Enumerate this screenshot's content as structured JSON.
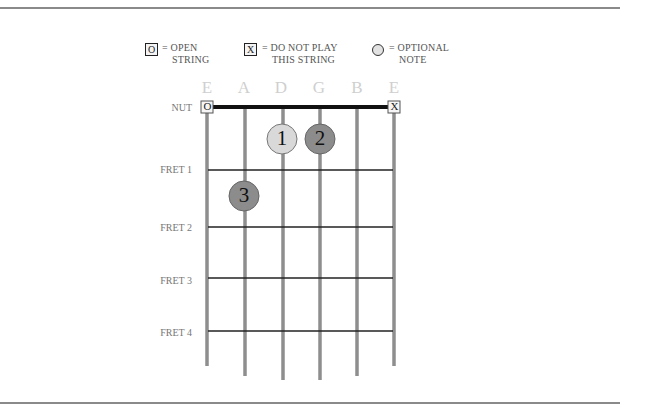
{
  "legend": [
    {
      "symbol": "O",
      "symbol_type": "box",
      "text_line1": "= OPEN",
      "text_line2": "STRING"
    },
    {
      "symbol": "X",
      "symbol_type": "box",
      "text_line1": "= DO NOT PLAY",
      "text_line2": "THIS STRING"
    },
    {
      "symbol": "",
      "symbol_type": "circle",
      "text_line1": "= OPTIONAL",
      "text_line2": "NOTE"
    }
  ],
  "strings": [
    "E",
    "A",
    "D",
    "G",
    "B",
    "E"
  ],
  "nut": {
    "label": "NUT",
    "markers": [
      {
        "string": "E (low)",
        "symbol": "O"
      },
      {
        "string": "E (high)",
        "symbol": "X"
      }
    ]
  },
  "frets": [
    "FRET 1",
    "FRET 2",
    "FRET 3",
    "FRET 4"
  ],
  "notes": [
    {
      "finger": "1",
      "string": "D",
      "fret_position": "before fret 1",
      "style": "optional",
      "fill": "#d9d9d9"
    },
    {
      "finger": "2",
      "string": "G",
      "fret_position": "before fret 1",
      "style": "played",
      "fill": "#8c8c8c"
    },
    {
      "finger": "3",
      "string": "A",
      "fret_position": "between fret 1 and fret 2",
      "style": "played",
      "fill": "#8c8c8c"
    }
  ],
  "colors": {
    "string": "#8e8e8e",
    "fret": "#222222",
    "nut": "#111111",
    "string_name": "#cfcfcf",
    "played_note": "#8c8c8c",
    "optional_note": "#d9d9d9"
  }
}
